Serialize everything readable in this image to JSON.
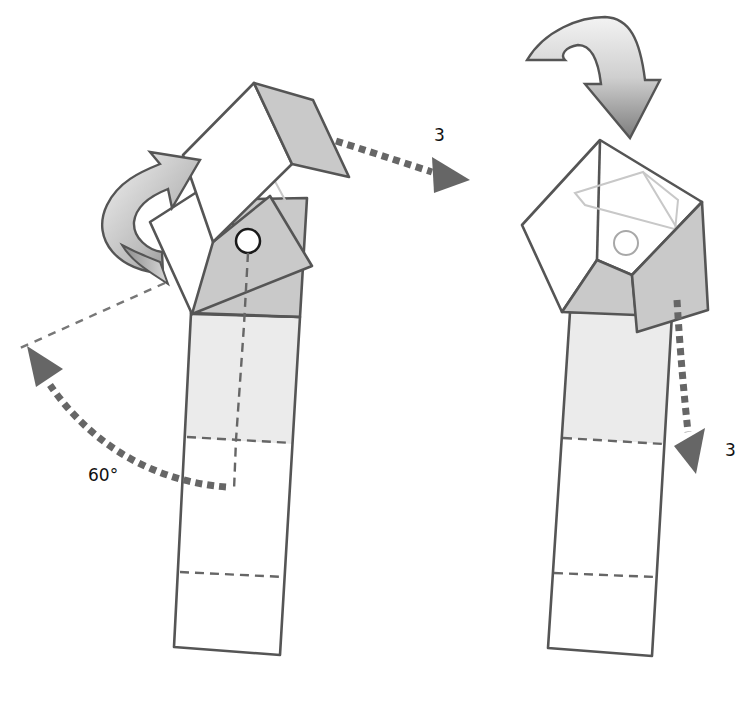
{
  "diagram": {
    "type": "origami-fold-steps",
    "steps": [
      {
        "id": "left",
        "labels": {
          "angle": "60°",
          "move_count": "3"
        },
        "arrows": [
          "curved-rotate-arrow",
          "dotted-move-arrow-right",
          "dotted-angle-arc-arrow"
        ],
        "marker": "pivot-circle"
      },
      {
        "id": "right",
        "labels": {
          "move_count": "3"
        },
        "arrows": [
          "curved-fold-down-arrow",
          "dotted-move-arrow-down"
        ],
        "marker": "pivot-circle-faint"
      }
    ],
    "colors": {
      "edge": "#555555",
      "shade_light": "#ebebeb",
      "shade_mid": "#c9c9c9",
      "arrow": "#666666"
    }
  }
}
